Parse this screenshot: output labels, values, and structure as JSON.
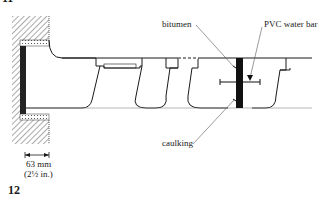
{
  "figure": {
    "number": "12",
    "top_fragment": "11"
  },
  "labels": {
    "bitumen": "bitumen",
    "pvc_water_bar": "PVC water bar",
    "caulking": "caulking"
  },
  "dimension": {
    "metric": "63 mm",
    "imperial": "(2½ in.)"
  },
  "colors": {
    "ink": "#1a1a1a",
    "hatch": "#555555",
    "seal": "#111111",
    "guide": "#888888"
  }
}
